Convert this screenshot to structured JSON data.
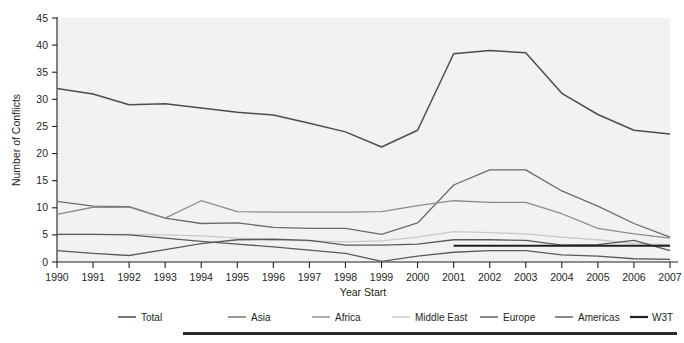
{
  "chart_data": {
    "type": "line",
    "title": "",
    "xlabel": "Year Start",
    "ylabel": "Number of Conflicts",
    "x": [
      1990,
      1991,
      1992,
      1993,
      1994,
      1995,
      1996,
      1997,
      1998,
      1999,
      2000,
      2001,
      2002,
      2003,
      2004,
      2005,
      2006,
      2007
    ],
    "xlim": [
      1990,
      2007
    ],
    "ylim": [
      0,
      45
    ],
    "yticks": [
      0,
      5,
      10,
      15,
      20,
      25,
      30,
      35,
      40,
      45
    ],
    "xticks": [
      "1990",
      "1991",
      "1992",
      "1993",
      "1994",
      "1995",
      "1996",
      "1997",
      "1998",
      "1999",
      "2000",
      "2001",
      "2002",
      "2003",
      "2004",
      "2005",
      "2006",
      "2007"
    ],
    "grid": false,
    "legend_position": "bottom",
    "series": [
      {
        "name": "Total",
        "color": "#4d4d4d",
        "width": 1.5,
        "values": [
          32,
          31,
          29,
          29.2,
          28.4,
          27.6,
          27.1,
          25.6,
          24,
          21.2,
          24.3,
          38.4,
          39,
          38.6,
          31.1,
          27.2,
          24.3,
          23.6
        ]
      },
      {
        "name": "Asia",
        "color": "#6b6b6b",
        "width": 1.3,
        "values": [
          11.2,
          10.3,
          10.2,
          8.1,
          7.1,
          7.2,
          6.4,
          6.2,
          6.2,
          5.1,
          7.2,
          14.2,
          17,
          17,
          13.1,
          10.3,
          7.1,
          4.6
        ]
      },
      {
        "name": "Africa",
        "color": "#8c8c8c",
        "width": 1.3,
        "values": [
          8.8,
          10.1,
          10.1,
          8.1,
          11.3,
          9.3,
          9.2,
          9.2,
          9.2,
          9.3,
          10.4,
          11.3,
          11,
          11,
          8.9,
          6.2,
          5.2,
          4.4
        ]
      },
      {
        "name": "Middle East",
        "color": "#c9c9c9",
        "width": 1.3,
        "values": [
          5.1,
          5.1,
          5.1,
          5,
          4.8,
          4.4,
          4.1,
          3.9,
          3.7,
          3.9,
          4.6,
          5.6,
          5.4,
          5.2,
          4.6,
          4.1,
          3.4,
          3.2
        ]
      },
      {
        "name": "Europe",
        "color": "#5a5a5a",
        "width": 1.3,
        "values": [
          5.1,
          5.1,
          5,
          4.4,
          3.8,
          3.3,
          2.8,
          2.2,
          1.6,
          0.1,
          1.1,
          1.8,
          2.1,
          2.1,
          1.3,
          1.1,
          0.6,
          0.5
        ]
      },
      {
        "name": "Americas",
        "color": "#595959",
        "width": 1.3,
        "values": [
          2.1,
          1.6,
          1.2,
          2.3,
          3.4,
          4.1,
          4.2,
          4,
          3.1,
          3.1,
          3.3,
          4.1,
          4.1,
          4,
          3.1,
          3.2,
          4,
          2.1
        ]
      },
      {
        "name": "W3T",
        "color": "#231f20",
        "width": 2.2,
        "values": [
          null,
          null,
          null,
          null,
          null,
          null,
          null,
          null,
          null,
          null,
          null,
          3,
          3,
          3,
          3,
          3,
          3,
          3
        ]
      }
    ]
  },
  "axis": {
    "y_title": "Number of Conflicts",
    "x_title": "Year Start",
    "y_ticks": [
      "0",
      "5",
      "10",
      "15",
      "20",
      "25",
      "30",
      "35",
      "40",
      "45"
    ],
    "x_ticks": [
      "1990",
      "1991",
      "1992",
      "1993",
      "1994",
      "1995",
      "1996",
      "1997",
      "1998",
      "1999",
      "2000",
      "2001",
      "2002",
      "2003",
      "2004",
      "2005",
      "2006",
      "2007"
    ]
  },
  "legend": {
    "items": [
      {
        "label": "Total"
      },
      {
        "label": "Asia"
      },
      {
        "label": "Africa"
      },
      {
        "label": "Middle East"
      },
      {
        "label": "Europe"
      },
      {
        "label": "Americas"
      },
      {
        "label": "W3T"
      }
    ]
  }
}
